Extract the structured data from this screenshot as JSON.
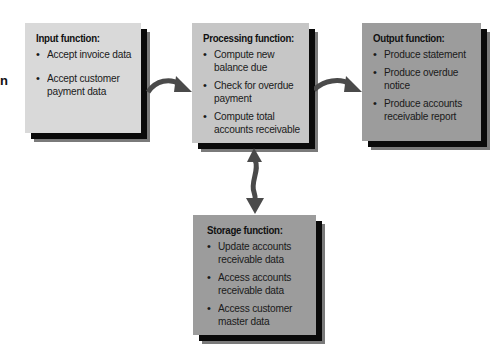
{
  "edge_fragment": "n",
  "colors": {
    "input_fill": "#d9d9d9",
    "processing_fill": "#c6c6c6",
    "output_fill": "#9c9c9c",
    "storage_fill": "#9c9c9c",
    "arrow": "#4a4a4a",
    "shadow": "#0a0a0a"
  },
  "boxes": {
    "input": {
      "title": "Input function:",
      "items": [
        [
          "Accept invoice data"
        ],
        [
          "Accept customer",
          "payment data"
        ]
      ]
    },
    "processing": {
      "title": "Processing function:",
      "items": [
        [
          "Compute new",
          "balance due"
        ],
        [
          "Check for overdue",
          "payment"
        ],
        [
          "Compute total",
          "accounts receivable"
        ]
      ]
    },
    "output": {
      "title": "Output function:",
      "items": [
        [
          "Produce statement"
        ],
        [
          "Produce overdue",
          "notice"
        ],
        [
          "Produce accounts",
          "receivable report"
        ]
      ]
    },
    "storage": {
      "title": "Storage function:",
      "items": [
        [
          "Update accounts",
          "receivable data"
        ],
        [
          "Access accounts",
          "receivable data"
        ],
        [
          "Access customer",
          "master data"
        ]
      ]
    }
  },
  "arrows": [
    {
      "from": "input",
      "to": "processing",
      "icon": "curved-arrow-right"
    },
    {
      "from": "processing",
      "to": "output",
      "icon": "curved-arrow-right"
    },
    {
      "from": "processing",
      "to": "storage",
      "icon": "double-headed-arrow-vertical"
    }
  ]
}
